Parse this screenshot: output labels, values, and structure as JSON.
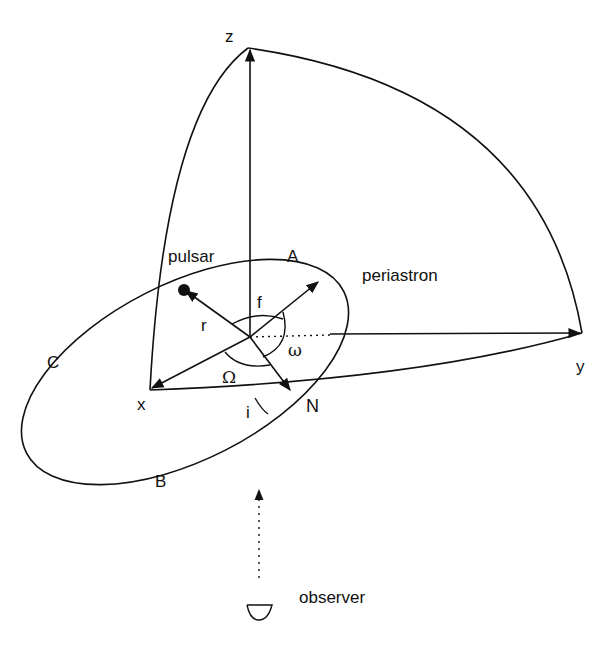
{
  "diagram": {
    "axes": {
      "x": "x",
      "y": "y",
      "z": "z"
    },
    "points": {
      "periastron_marker": "A",
      "point_c": "C",
      "point_b": "B",
      "ascending_node": "N"
    },
    "labels": {
      "pulsar": "pulsar",
      "periastron": "periastron",
      "observer": "observer",
      "radius": "r",
      "true_anomaly": "f",
      "argument_of_periastron": "ω",
      "longitude_of_node": "Ω",
      "inclination": "i"
    },
    "colors": {
      "ink": "#111111",
      "background": "#ffffff"
    }
  }
}
